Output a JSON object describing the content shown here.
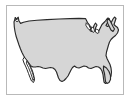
{
  "figure": {
    "name": "united-states-outline-map",
    "title": "Map of the contiguous United States",
    "width": 131,
    "height": 103,
    "background_color": "#ffffff"
  },
  "frame": {
    "name": "map-frame",
    "border_color": "#b9b9b9",
    "fill_color": "#ffffff",
    "left": 6,
    "top": 5,
    "width": 118,
    "height": 90
  },
  "map": {
    "projection_style": "simplified outline",
    "land_fill_color": "#d6d6d6",
    "outline_color": "#2a2a2a",
    "water_fill_color": "#ffffff",
    "labels": [],
    "regions": [
      {
        "id": "contiguous-united-states",
        "name": "Contiguous United States",
        "style": "filled",
        "fill": "#d6d6d6",
        "path": "M 7 16 L 8.4 11.6 L 9.8 13.4 L 11.2 11.2 L 12.0 15.0 L 13.6 17.4 L 16.5 16.2 L 22 15.0 L 30 14.2 L 40 13.6 L 52 13.0 L 63 12.6 L 72 12.4 L 78.5 12.6 L 80.5 16.5 L 82.5 19.0 L 84.0 22.0 L 83.0 24.5 L 84.5 25.5 L 86.0 23.0 L 87.0 19.5 L 88.5 17.0 L 90.0 19.0 L 88.5 22.0 L 88.0 25.0 L 90.0 26.5 L 92.0 24.5 L 93.5 21.5 L 95.0 18.5 L 96.5 17.0 L 98.0 15.5 L 99.5 13.5 L 101.0 12.0 L 102.5 13.0 L 101.5 15.5 L 100.0 17.5 L 99.0 19.5 L 100.5 20.5 L 103.0 19.0 L 104.5 16.0 L 106.0 13.0 L 107.5 11.0 L 109.0 12.5 L 108.0 15.5 L 107.0 18.5 L 108.5 20.0 L 110.5 21.5 L 111.5 24.0 L 110.5 27.0 L 108.5 29.5 L 106.0 31.5 L 104.0 33.5 L 102.5 36.0 L 101.5 39.0 L 100.5 42.5 L 99.5 46.0 L 99.0 49.5 L 100.0 52.5 L 101.5 55.5 L 103.0 58.5 L 104.0 62.0 L 104.5 66.0 L 104.0 70.0 L 102.5 73.5 L 100.5 76.0 L 98.5 77.5 L 97.0 76.0 L 96.5 72.5 L 96.0 68.5 L 95.0 65.0 L 93.5 62.5 L 91.5 61.0 L 89.0 60.5 L 86.5 61.5 L 84.0 62.5 L 81.5 62.0 L 79.5 60.5 L 77.0 60.0 L 74.5 61.0 L 72.0 62.0 L 69.5 61.5 L 67.5 60.0 L 65.5 61.5 L 64.0 64.0 L 62.5 67.0 L 61.0 70.0 L 59.0 72.5 L 57.0 74.5 L 55.0 75.5 L 53.0 74.5 L 51.5 72.0 L 50.5 69.0 L 49.5 66.0 L 48.0 63.5 L 46.0 62.0 L 43.5 61.5 L 41.0 62.0 L 38.5 62.5 L 36.0 62.0 L 33.5 61.0 L 31.0 60.5 L 28.5 61.0 L 26.0 61.0 L 24.0 60.0 L 22.5 58.0 L 21.0 56.0 L 19.5 54.0 L 18.0 52.0 L 16.5 49.5 L 15.0 46.5 L 13.5 43.0 L 12.0 39.0 L 10.5 34.5 L 9.0 30.0 L 8.0 25.5 L 7.3 21.0 Z"
      },
      {
        "id": "baja-california",
        "name": "Baja California peninsula",
        "style": "outline",
        "fill": "#ffffff",
        "path": "M 17.5 51.5 L 20.0 54.5 L 22.5 58.5 L 24.5 62.5 L 26.0 66.5 L 27.0 70.5 L 27.5 74.0 L 26.5 76.5 L 24.5 75.0 L 23.0 71.5 L 21.5 67.5 L 20.0 63.5 L 18.5 60.0 L 17.0 57.0 L 16.0 54.0 Z"
      },
      {
        "id": "gulf-of-california",
        "name": "Gulf of California",
        "style": "outline",
        "fill": "#ffffff",
        "path": "M 20.0 55.0 L 22.5 59.5 L 24.5 64.0 L 26.0 68.5 L 27.0 72.5 L 26.0 74.5 L 25.0 71.0 L 23.5 66.5 L 21.5 61.5 L 19.5 57.5 Z"
      },
      {
        "id": "great-lakes",
        "name": "Great Lakes",
        "style": "water",
        "fill": "#ffffff",
        "path": "M 79.5 17.0 L 82.0 19.5 L 83.5 22.5 L 82.5 24.0 L 80.5 22.0 L 79.0 19.5 Z M 85.0 21.0 L 87.0 22.5 L 87.5 25.5 L 86.0 26.5 L 84.5 24.0 Z M 89.0 23.0 L 91.5 24.0 L 92.0 26.5 L 90.0 27.5 L 88.5 25.5 Z"
      },
      {
        "id": "northeast-coast",
        "name": "Northeast coast and Maine",
        "style": "detail",
        "fill": "#d6d6d6",
        "path": "M 101.0 12.5 L 103.0 14.5 L 104.5 17.5 L 106.0 20.5 L 107.5 23.0 L 106.0 25.5 L 104.0 24.0 L 102.5 21.0 L 101.0 18.0 L 100.0 15.0 Z"
      },
      {
        "id": "puget-sound-notch",
        "name": "Puget Sound inlet (Washington)",
        "style": "detail",
        "fill": "#ffffff",
        "path": "M 8.4 11.8 L 9.5 14.0 L 10.6 11.6 L 11.4 14.8 L 10.0 16.0 L 8.6 14.4 Z"
      },
      {
        "id": "florida-peninsula",
        "name": "Florida peninsula",
        "style": "detail",
        "fill": "#d6d6d6",
        "path": "M 96.5 60.0 L 99.5 62.0 L 102.0 65.5 L 103.5 69.5 L 103.5 73.5 L 102.0 76.5 L 100.0 77.5 L 98.5 75.5 L 98.0 71.5 L 97.5 67.5 L 96.5 64.0 Z"
      }
    ]
  }
}
